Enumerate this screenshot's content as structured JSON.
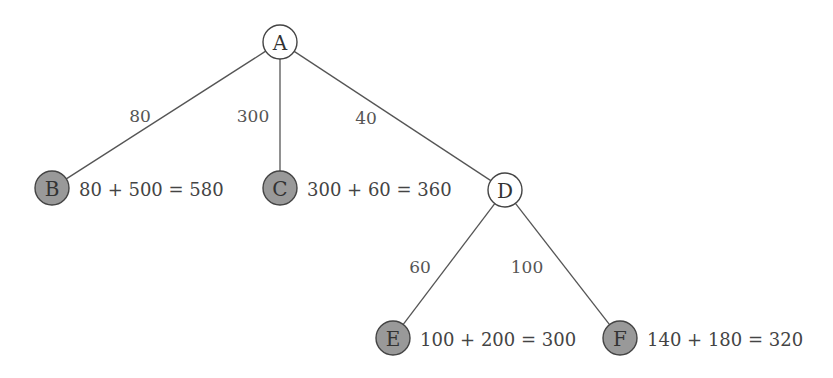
{
  "diagram": {
    "type": "tree",
    "colors": {
      "expanded_fill": "#ffffff",
      "frontier_fill": "#999999",
      "stroke": "#444444",
      "edge": "#555555"
    },
    "nodes": [
      {
        "id": "A",
        "label": "A",
        "x": 280,
        "y": 42,
        "filled": false,
        "cost_label": ""
      },
      {
        "id": "B",
        "label": "B",
        "x": 52,
        "y": 188,
        "filled": true,
        "cost_label": "80 + 500 = 580"
      },
      {
        "id": "C",
        "label": "C",
        "x": 280,
        "y": 188,
        "filled": true,
        "cost_label": "300 + 60 = 360"
      },
      {
        "id": "D",
        "label": "D",
        "x": 505,
        "y": 190,
        "filled": false,
        "cost_label": ""
      },
      {
        "id": "E",
        "label": "E",
        "x": 393,
        "y": 338,
        "filled": true,
        "cost_label": "100 + 200 = 300"
      },
      {
        "id": "F",
        "label": "F",
        "x": 620,
        "y": 338,
        "filled": true,
        "cost_label": "140 + 180 = 320"
      }
    ],
    "edges": [
      {
        "from": "A",
        "to": "B",
        "weight": "80",
        "lx": 140,
        "ly": 116
      },
      {
        "from": "A",
        "to": "C",
        "weight": "300",
        "lx": 253,
        "ly": 116
      },
      {
        "from": "A",
        "to": "D",
        "weight": "40",
        "lx": 366,
        "ly": 118
      },
      {
        "from": "D",
        "to": "E",
        "weight": "60",
        "lx": 420,
        "ly": 267
      },
      {
        "from": "D",
        "to": "F",
        "weight": "100",
        "lx": 527,
        "ly": 267
      }
    ]
  }
}
